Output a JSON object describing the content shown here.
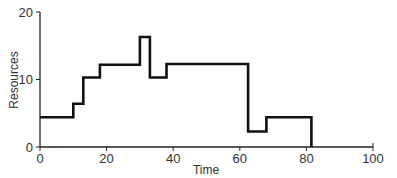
{
  "chart_data": {
    "type": "line",
    "subtype": "step",
    "title": "",
    "xlabel": "Time",
    "ylabel": "Resources",
    "xlim": [
      0,
      100
    ],
    "ylim": [
      0,
      20
    ],
    "x_ticks": [
      0,
      20,
      40,
      60,
      80,
      100
    ],
    "y_ticks": [
      0,
      10,
      20
    ],
    "grid": false,
    "legend": null,
    "series": [
      {
        "name": "Resources",
        "color": "#111111",
        "steps": [
          {
            "x_start": 0,
            "x_end": 10,
            "value": 4.4
          },
          {
            "x_start": 10,
            "x_end": 13,
            "value": 6.4
          },
          {
            "x_start": 13,
            "x_end": 18,
            "value": 10.3
          },
          {
            "x_start": 18,
            "x_end": 30,
            "value": 12.2
          },
          {
            "x_start": 30,
            "x_end": 33,
            "value": 16.3
          },
          {
            "x_start": 33,
            "x_end": 38,
            "value": 10.3
          },
          {
            "x_start": 38,
            "x_end": 62.5,
            "value": 12.3
          },
          {
            "x_start": 62.5,
            "x_end": 68,
            "value": 2.3
          },
          {
            "x_start": 68,
            "x_end": 81.5,
            "value": 4.4
          }
        ],
        "x": [
          0,
          10,
          10,
          13,
          13,
          18,
          18,
          30,
          30,
          33,
          33,
          38,
          38,
          62.5,
          62.5,
          68,
          68,
          81.5,
          81.5
        ],
        "y": [
          4.4,
          4.4,
          6.4,
          6.4,
          10.3,
          10.3,
          12.2,
          12.2,
          16.3,
          16.3,
          10.3,
          10.3,
          12.3,
          12.3,
          2.3,
          2.3,
          4.4,
          4.4,
          0
        ]
      }
    ]
  },
  "labels": {
    "xlabel": "Time",
    "ylabel": "Resources",
    "x_ticks": [
      "0",
      "20",
      "40",
      "60",
      "80",
      "100"
    ],
    "y_ticks": [
      "0",
      "10",
      "20"
    ]
  }
}
